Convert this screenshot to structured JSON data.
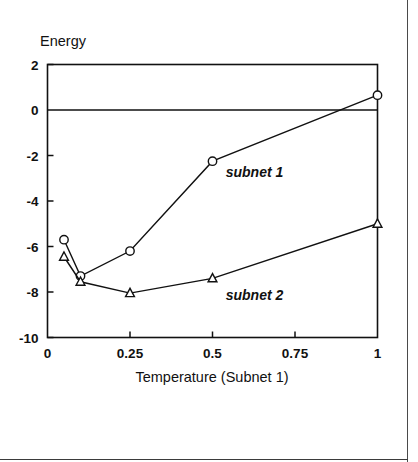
{
  "figure": {
    "background_color": "#ffffff",
    "ink_color": "#111111",
    "border_color": "#4a4a4a"
  },
  "chart_data": {
    "type": "line",
    "title": "",
    "subtitle": "",
    "xlabel": "Temperature (Subnet 1)",
    "ylabel": "Energy",
    "xlim": [
      0,
      1
    ],
    "ylim": [
      -10,
      2
    ],
    "xticks": [
      0,
      0.25,
      0.5,
      0.75,
      1
    ],
    "xtick_labels": [
      "0",
      "0.25",
      "0.5",
      "0.75",
      "1"
    ],
    "yticks": [
      2,
      0,
      -2,
      -4,
      -6,
      -8,
      -10
    ],
    "ytick_labels": [
      "2",
      "0",
      "-2",
      "-4",
      "-6",
      "-8",
      "-10"
    ],
    "grid": false,
    "legend_position": "inline-annotation",
    "zero_line": 0,
    "series": [
      {
        "name": "subnet 1",
        "marker": "circle",
        "x": [
          0.05,
          0.1,
          0.25,
          0.5,
          1.0
        ],
        "values": [
          -5.7,
          -7.3,
          -6.2,
          -2.25,
          0.65
        ]
      },
      {
        "name": "subnet 2",
        "marker": "triangle",
        "x": [
          0.05,
          0.1,
          0.25,
          0.5,
          1.0
        ],
        "values": [
          -6.45,
          -7.55,
          -8.05,
          -7.4,
          -5.0
        ]
      }
    ],
    "annotations": [
      {
        "text": "subnet 1",
        "x": 0.54,
        "y": -2.95
      },
      {
        "text": "subnet 2",
        "x": 0.54,
        "y": -8.35
      }
    ]
  }
}
